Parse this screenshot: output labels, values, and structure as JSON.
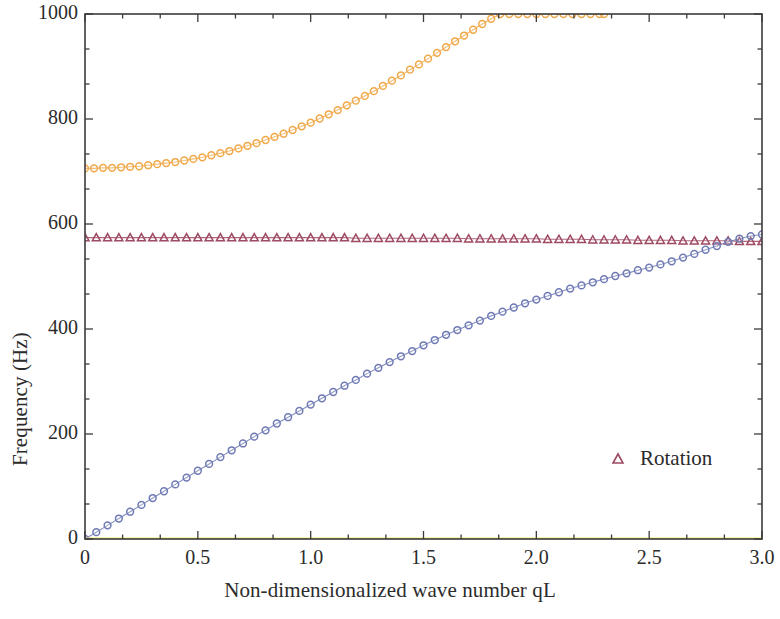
{
  "chart_data": {
    "type": "scatter",
    "title": "",
    "xlabel": "Non-dimensionalized wave number qL",
    "ylabel": "Frequency (Hz)",
    "xlim": [
      0,
      3.0
    ],
    "ylim": [
      0,
      1000
    ],
    "xticks": [
      0,
      0.5,
      1.0,
      1.5,
      2.0,
      2.5,
      3.0
    ],
    "xtick_labels": [
      "0",
      "0.5",
      "1.0",
      "1.5",
      "2.0",
      "2.5",
      "3.0"
    ],
    "yticks": [
      0,
      200,
      400,
      600,
      800,
      1000
    ],
    "ytick_labels": [
      "0",
      "200",
      "400",
      "600",
      "800",
      "1000"
    ],
    "x_minor_ticks_per_interval": 2,
    "y_minor_ticks_per_interval": 2,
    "grid": false,
    "legend_position": "inside-lower-right",
    "legend": [
      {
        "name": "Rotation",
        "marker": "triangle",
        "color": "#9e4a62",
        "fill": "open"
      }
    ],
    "series": [
      {
        "name": "optical-upper",
        "marker": "circle",
        "color": "#f0a849",
        "fill": "open",
        "x": [
          0.0,
          0.04,
          0.08,
          0.12,
          0.16,
          0.2,
          0.24,
          0.28,
          0.32,
          0.36,
          0.4,
          0.44,
          0.48,
          0.52,
          0.56,
          0.6,
          0.64,
          0.68,
          0.72,
          0.76,
          0.8,
          0.84,
          0.88,
          0.92,
          0.96,
          1.0,
          1.04,
          1.08,
          1.12,
          1.16,
          1.2,
          1.24,
          1.28,
          1.32,
          1.36,
          1.4,
          1.44,
          1.48,
          1.52,
          1.56,
          1.6,
          1.64,
          1.68,
          1.72,
          1.76,
          1.8,
          1.84,
          1.88,
          1.92,
          1.96,
          2.0,
          2.04,
          2.08,
          2.12,
          2.16,
          2.2,
          2.24,
          2.28,
          2.3
        ],
        "y": [
          706,
          706,
          707,
          707,
          708,
          709,
          710,
          712,
          714,
          716,
          718,
          721,
          724,
          727,
          731,
          735,
          739,
          744,
          749,
          754,
          760,
          766,
          772,
          779,
          786,
          793,
          801,
          809,
          817,
          826,
          835,
          844,
          853,
          863,
          873,
          883,
          894,
          904,
          915,
          926,
          937,
          948,
          959,
          970,
          981,
          991,
          1000,
          1000,
          1000,
          1000,
          1000,
          1000,
          1000,
          1000,
          1000,
          1000,
          1000,
          1000,
          1000
        ]
      },
      {
        "name": "rotation-branch",
        "marker": "triangle",
        "color": "#9e4a62",
        "fill": "open",
        "x": [
          0.0,
          0.05,
          0.1,
          0.15,
          0.2,
          0.25,
          0.3,
          0.35,
          0.4,
          0.45,
          0.5,
          0.55,
          0.6,
          0.65,
          0.7,
          0.75,
          0.8,
          0.85,
          0.9,
          0.95,
          1.0,
          1.05,
          1.1,
          1.15,
          1.2,
          1.25,
          1.3,
          1.35,
          1.4,
          1.45,
          1.5,
          1.55,
          1.6,
          1.65,
          1.7,
          1.75,
          1.8,
          1.85,
          1.9,
          1.95,
          2.0,
          2.05,
          2.1,
          2.15,
          2.2,
          2.25,
          2.3,
          2.35,
          2.4,
          2.45,
          2.5,
          2.55,
          2.6,
          2.65,
          2.7,
          2.75,
          2.8,
          2.85,
          2.9,
          2.95,
          3.0
        ],
        "y": [
          574,
          574,
          574,
          574,
          574,
          574,
          574,
          574,
          574,
          574,
          574,
          574,
          574,
          574,
          574,
          574,
          574,
          574,
          574,
          574,
          574,
          574,
          574,
          574,
          573,
          573,
          573,
          573,
          573,
          573,
          573,
          573,
          573,
          573,
          572,
          572,
          572,
          572,
          572,
          572,
          572,
          571,
          571,
          571,
          571,
          570,
          570,
          570,
          570,
          569,
          569,
          569,
          569,
          568,
          568,
          568,
          568,
          568,
          567,
          567,
          567
        ]
      },
      {
        "name": "acoustic-branch",
        "marker": "circle",
        "color": "#6f7ab5",
        "fill": "open",
        "x": [
          0.0,
          0.05,
          0.1,
          0.15,
          0.2,
          0.25,
          0.3,
          0.35,
          0.4,
          0.45,
          0.5,
          0.55,
          0.6,
          0.65,
          0.7,
          0.75,
          0.8,
          0.85,
          0.9,
          0.95,
          1.0,
          1.05,
          1.1,
          1.15,
          1.2,
          1.25,
          1.3,
          1.35,
          1.4,
          1.45,
          1.5,
          1.55,
          1.6,
          1.65,
          1.7,
          1.75,
          1.8,
          1.85,
          1.9,
          1.95,
          2.0,
          2.05,
          2.1,
          2.15,
          2.2,
          2.25,
          2.3,
          2.35,
          2.4,
          2.45,
          2.5,
          2.55,
          2.6,
          2.65,
          2.7,
          2.75,
          2.8,
          2.85,
          2.9,
          2.95,
          3.0
        ],
        "y": [
          0,
          13,
          26,
          39,
          52,
          65,
          78,
          91,
          104,
          117,
          130,
          143,
          156,
          169,
          182,
          195,
          207,
          220,
          232,
          244,
          256,
          268,
          280,
          292,
          303,
          315,
          326,
          337,
          348,
          358,
          369,
          379,
          389,
          398,
          407,
          416,
          425,
          433,
          441,
          449,
          456,
          463,
          470,
          477,
          483,
          489,
          495,
          501,
          506,
          512,
          517,
          523,
          529,
          536,
          543,
          551,
          558,
          566,
          572,
          577,
          580
        ]
      },
      {
        "name": "zero-branch",
        "marker": "line",
        "color": "#efe96a",
        "fill": "solid",
        "x": [
          0.0,
          3.0
        ],
        "y": [
          0,
          0
        ]
      }
    ]
  }
}
